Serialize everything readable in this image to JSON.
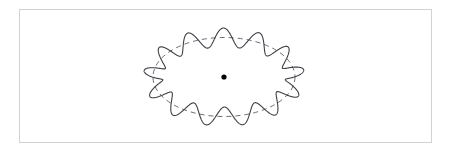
{
  "figure": {
    "title": "Wavy perturbed ellipse with dashed mean contour and center point",
    "caption": "",
    "background_color": "#ffffff",
    "frame": {
      "name": "figure-border",
      "x": 19,
      "y": 9,
      "width": 413,
      "height": 134,
      "stroke_color": "#d2d2d2",
      "stroke_width": 1.5,
      "fill": "#ffffff"
    },
    "center_point": {
      "name": "center-dot",
      "cx": 224,
      "cy": 77,
      "radius": 2.6,
      "color": "#000000"
    },
    "mean_ellipse": {
      "name": "dashed-mean-ellipse",
      "cx": 224,
      "cy": 77,
      "rx": 71,
      "ry": 39.5,
      "stroke_color": "#5a5a62",
      "stroke_width": 0.9,
      "dash_pattern": "5,4",
      "fill": "none"
    },
    "wavy_curve": {
      "name": "perturbed-contour",
      "cx": 224,
      "cy": 77,
      "rx": 71,
      "ry": 39.5,
      "lobes": 13,
      "amplitude_radial": 9.5,
      "phase_deg": 95,
      "stroke_color": "#3f3f48",
      "stroke_width": 1.1,
      "fill": "none",
      "samples": 1440
    }
  },
  "chart_data": {
    "type": "line",
    "title": "Wavy perturbed ellipse with dashed mean contour",
    "xlabel": "",
    "ylabel": "",
    "legend": [],
    "grid": false,
    "series": [
      {
        "name": "mean-ellipse",
        "style": "dashed",
        "color": "#5a5a62",
        "form": "ellipse",
        "center": [
          224,
          77
        ],
        "semi_axes": [
          71,
          39.5
        ]
      },
      {
        "name": "perturbed-contour",
        "style": "solid",
        "color": "#3f3f48",
        "form": "r(theta) = 1 + A*cos(n*theta + phase) applied radially to ellipse",
        "center": [
          224,
          77
        ],
        "semi_axes": [
          71,
          39.5
        ],
        "lobes": 13,
        "radial_amplitude_px": 9.5,
        "phase_deg": 95
      },
      {
        "name": "center-marker",
        "style": "point",
        "color": "#000000",
        "points": [
          [
            224,
            77
          ]
        ]
      }
    ]
  }
}
